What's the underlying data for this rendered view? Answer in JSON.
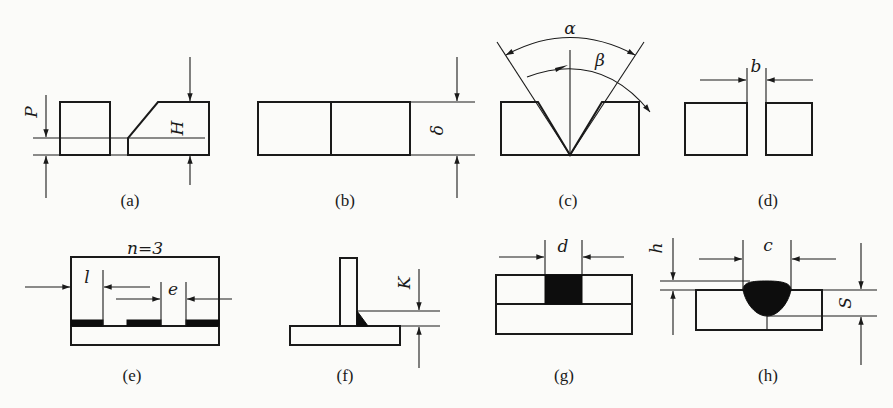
{
  "figure": {
    "panels": [
      {
        "id": "a",
        "label": "(a)",
        "symbols": [
          "P",
          "H"
        ],
        "description": "Bevel preparation with root face P and bevel height H"
      },
      {
        "id": "b",
        "label": "(b)",
        "symbols": [
          "δ"
        ],
        "description": "Square butt joint with plate thickness δ"
      },
      {
        "id": "c",
        "label": "(c)",
        "symbols": [
          "α",
          "β"
        ],
        "description": "V-groove with groove angle α and bevel angle β"
      },
      {
        "id": "d",
        "label": "(d)",
        "symbols": [
          "b"
        ],
        "description": "Butt joint with root gap b"
      },
      {
        "id": "e",
        "label": "(e)",
        "symbols": [
          "n=3",
          "l",
          "e"
        ],
        "description": "Intermittent weld with n segments, weld length l and spacing e"
      },
      {
        "id": "f",
        "label": "(f)",
        "symbols": [
          "K"
        ],
        "description": "T-joint fillet weld with leg size K"
      },
      {
        "id": "g",
        "label": "(g)",
        "symbols": [
          "d"
        ],
        "description": "Plug weld with diameter d"
      },
      {
        "id": "h",
        "label": "(h)",
        "symbols": [
          "h",
          "c",
          "S"
        ],
        "description": "Weld with reinforcement h, width c and penetration S"
      }
    ]
  },
  "labels": {
    "a": "(a)",
    "b": "(b)",
    "c": "(c)",
    "d": "(d)",
    "e": "(e)",
    "f": "(f)",
    "g": "(g)",
    "h": "(h)"
  },
  "symbols": {
    "P": "P",
    "H": "H",
    "delta": "δ",
    "alpha": "α",
    "beta": "β",
    "b": "b",
    "n": "n=3",
    "l": "l",
    "e": "e",
    "K": "K",
    "d": "d",
    "h": "h",
    "c": "c",
    "S": "S"
  },
  "colors": {
    "ink": "#1a1a1a",
    "paper": "#fbfbf9",
    "weld_fill": "#0d0d0d"
  }
}
